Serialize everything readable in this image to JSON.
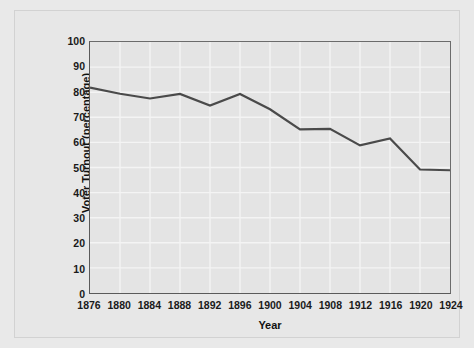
{
  "figure": {
    "background_color": "#e7e7e7",
    "plot_background_color": "#e4e4e4",
    "grid_color": "#f4f4f4",
    "axis_color": "#5a5a5a",
    "line_color": "#4a4a4a"
  },
  "chart_data": {
    "type": "line",
    "title": "",
    "xlabel": "Year",
    "ylabel": "Voter Turnout (percentage)",
    "x": [
      1876,
      1880,
      1884,
      1888,
      1892,
      1896,
      1900,
      1904,
      1908,
      1912,
      1916,
      1920,
      1924
    ],
    "values": [
      81.8,
      79.4,
      77.5,
      79.3,
      74.7,
      79.3,
      73.2,
      65.2,
      65.4,
      58.8,
      61.6,
      49.2,
      48.9
    ],
    "xticklabels": [
      "1876",
      "1880",
      "1884",
      "1888",
      "1892",
      "1896",
      "1900",
      "1904",
      "1908",
      "1912",
      "1916",
      "1920",
      "1924"
    ],
    "yticklabels": [
      "100",
      "90",
      "80",
      "70",
      "60",
      "50",
      "40",
      "30",
      "20",
      "10",
      "0"
    ],
    "yticks": [
      100,
      90,
      80,
      70,
      60,
      50,
      40,
      30,
      20,
      10,
      0
    ],
    "xlim": [
      1876,
      1924
    ],
    "ylim": [
      0,
      100
    ],
    "grid": true,
    "legend": null,
    "series_name": "Voter Turnout"
  }
}
